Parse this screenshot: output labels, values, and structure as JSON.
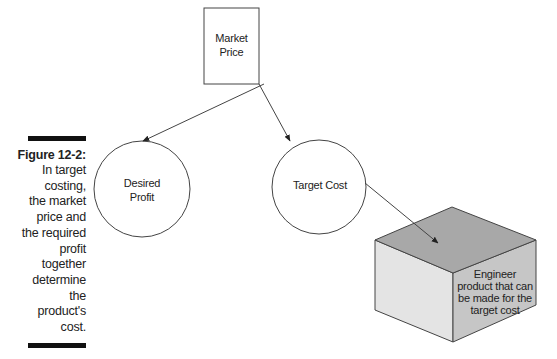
{
  "figure": {
    "number": "Figure 12-2:",
    "caption_lines": [
      "In target",
      "costing,",
      "the market",
      "price and",
      "the required",
      "profit",
      "together",
      "determine",
      "the",
      "product's",
      "cost."
    ]
  },
  "diagram": {
    "nodes": {
      "market_price": {
        "shape": "rectangle",
        "lines": [
          "Market",
          "Price"
        ]
      },
      "desired_profit": {
        "shape": "circle",
        "lines": [
          "Desired",
          "Profit"
        ]
      },
      "target_cost": {
        "shape": "circle",
        "lines": [
          "Target Cost"
        ]
      },
      "engineer_product": {
        "shape": "cube",
        "lines": [
          "Engineer",
          "product that can",
          "be made for the",
          "target cost"
        ]
      }
    },
    "edges": [
      {
        "from": "market_price",
        "to": "desired_profit"
      },
      {
        "from": "market_price",
        "to": "target_cost"
      },
      {
        "from": "target_cost",
        "to": "engineer_product"
      }
    ],
    "colors": {
      "stroke": "#333333",
      "cube_top": "#a9a9a9",
      "cube_left": "#e6e6e6",
      "cube_right": "#c8c8c8"
    }
  }
}
